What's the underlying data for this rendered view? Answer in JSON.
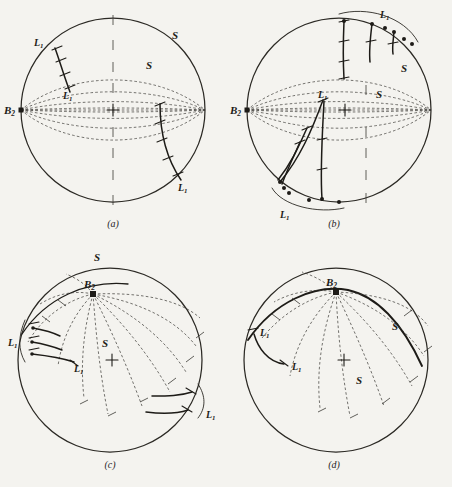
{
  "figure": {
    "background_color": "#f4f3ef",
    "ink_color": "#1d1b17",
    "panels": [
      {
        "id": "a",
        "caption": "(a)",
        "center": [
          113,
          110
        ],
        "radius": 92,
        "basepoint": {
          "label": "B",
          "subscript": "2",
          "position": [
            21,
            110
          ]
        },
        "surface_labels": [
          {
            "label": "S",
            "position": [
              176,
              34
            ]
          },
          {
            "label": "S",
            "position": [
              150,
              64
            ]
          }
        ],
        "curve_labels": [
          {
            "label": "L",
            "subscript": "1",
            "position": [
              42,
              41
            ]
          },
          {
            "label": "L",
            "subscript": "1",
            "position": [
              71,
              94
            ]
          },
          {
            "label": "L",
            "subscript": "1",
            "position": [
              186,
              186
            ]
          }
        ],
        "latitude_count": 9,
        "meridian_count": 11,
        "center_marker": "plus-cross",
        "description": "Horizontal-axis sphere, meridians converge at left and right poles, two solid L1 arcs"
      },
      {
        "id": "b",
        "caption": "(b)",
        "center": [
          339,
          110
        ],
        "radius": 92,
        "basepoint": {
          "label": "B",
          "subscript": "2",
          "position": [
            247,
            110
          ]
        },
        "surface_labels": [
          {
            "label": "S",
            "position": [
              406,
              68
            ]
          },
          {
            "label": "S",
            "position": [
              382,
              94
            ]
          }
        ],
        "curve_labels": [
          {
            "label": "L",
            "subscript": "1",
            "position": [
              397,
              14
            ]
          },
          {
            "label": "L",
            "subscript": "1",
            "position": [
              325,
              99
            ]
          },
          {
            "label": "L",
            "subscript": "1",
            "position": [
              287,
              211
            ]
          }
        ],
        "latitude_count": 9,
        "meridian_count": 11,
        "center_marker": "plus-cross",
        "brackets": [
          {
            "name": "upper-right-bracket",
            "label": "L1"
          },
          {
            "name": "lower-left-bracket",
            "label": "L1"
          }
        ],
        "description": "Bundle of solid L1 arcs terminating in dots on the rim, spanned by curved brackets"
      },
      {
        "id": "c",
        "caption": "(c)",
        "center": [
          110,
          360
        ],
        "radius": 92,
        "basepoint": {
          "label": "B",
          "subscript": "2",
          "position": [
            93,
            292
          ]
        },
        "surface_labels": [
          {
            "label": "S",
            "position": [
              99,
              255
            ]
          },
          {
            "label": "S",
            "position": [
              108,
              344
            ]
          }
        ],
        "curve_labels": [
          {
            "label": "L",
            "subscript": "1",
            "position": [
              16,
              342
            ]
          },
          {
            "label": "L",
            "subscript": "1",
            "position": [
              80,
              366
            ]
          },
          {
            "label": "L",
            "subscript": "1",
            "position": [
              212,
              416
            ]
          }
        ],
        "meridian_count": 13,
        "center_marker": "plus-cross",
        "brackets": [
          {
            "name": "left-bracket",
            "label": "L1"
          },
          {
            "name": "right-bracket",
            "label": "L1"
          }
        ],
        "description": "Tilted sphere, B2 node above center, dashed meridians radiate and sweep to lower right"
      },
      {
        "id": "d",
        "caption": "(d)",
        "center": [
          336,
          360
        ],
        "radius": 92,
        "basepoint": {
          "label": "B",
          "subscript": "2",
          "position": [
            318,
            292
          ]
        },
        "surface_labels": [
          {
            "label": "S",
            "position": [
              398,
              326
            ]
          },
          {
            "label": "S",
            "position": [
              361,
              380
            ]
          }
        ],
        "curve_labels": [
          {
            "label": "L",
            "subscript": "1",
            "position": [
              270,
              332
            ]
          },
          {
            "label": "L",
            "subscript": "1",
            "position": [
              297,
              363
            ]
          }
        ],
        "meridian_count": 13,
        "center_marker": "plus-cross",
        "description": "Tilted sphere with one heavy S geodesic sweeping from upper left through B2 to lower right"
      }
    ]
  }
}
